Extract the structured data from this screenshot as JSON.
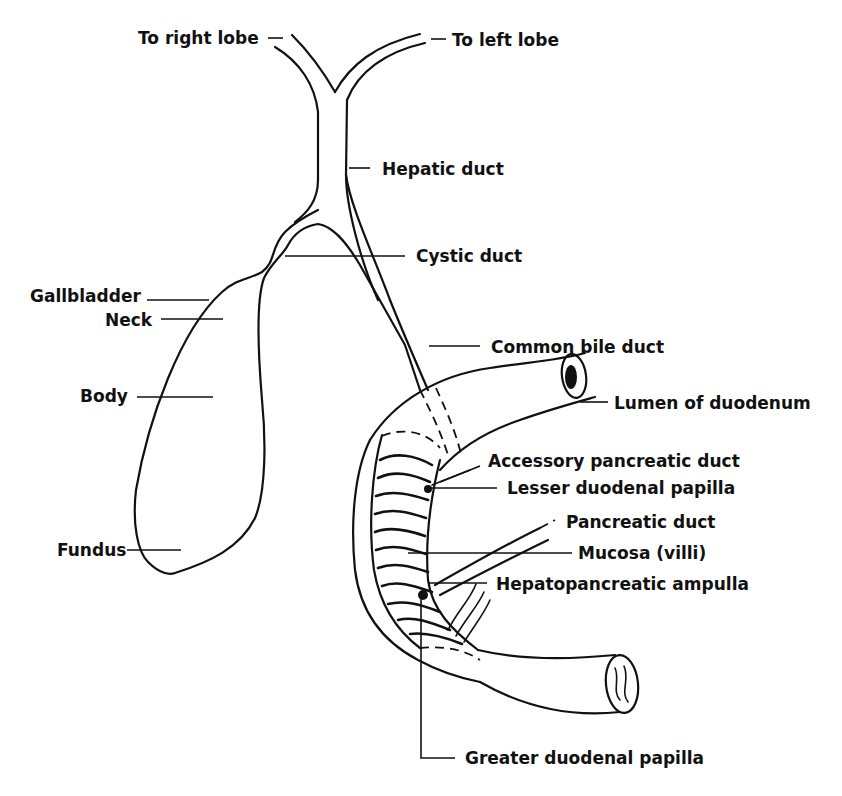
{
  "diagram": {
    "colors": {
      "ink": "#111111",
      "background": "#ffffff"
    },
    "labels": {
      "to_right_lobe": "To right lobe",
      "to_left_lobe": "To left lobe",
      "hepatic_duct": "Hepatic duct",
      "cystic_duct": "Cystic duct",
      "gallbladder": "Gallbladder",
      "neck": "Neck",
      "body": "Body",
      "fundus": "Fundus",
      "common_bile_duct": "Common bile duct",
      "lumen_of_duodenum": "Lumen of duodenum",
      "accessory_pancreatic_duct": "Accessory pancreatic duct",
      "lesser_duodenal_papilla": "Lesser duodenal papilla",
      "pancreatic_duct": "Pancreatic duct",
      "mucosa_villi": "Mucosa (villi)",
      "hepatopancreatic_ampulla": "Hepatopancreatic ampulla",
      "greater_duodenal_papilla": "Greater duodenal papilla"
    }
  }
}
